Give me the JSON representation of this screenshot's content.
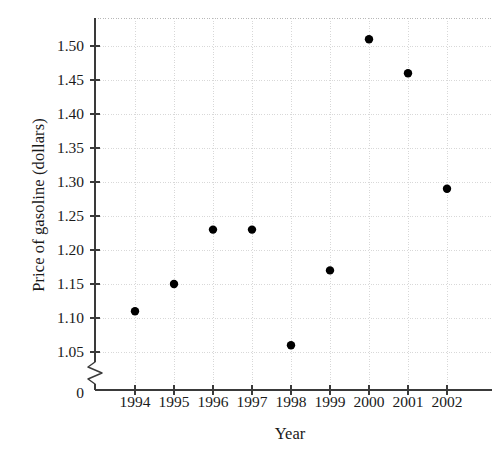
{
  "chart_data": {
    "type": "scatter",
    "title": "",
    "xlabel": "Year",
    "ylabel": "Price of gasoline (dollars)",
    "x": [
      1994,
      1995,
      1996,
      1997,
      1998,
      1999,
      2000,
      2001,
      2002
    ],
    "values": [
      1.11,
      1.15,
      1.23,
      1.23,
      1.06,
      1.17,
      1.51,
      1.46,
      1.29
    ],
    "points": [
      {
        "year": "1994",
        "price": "1.11"
      },
      {
        "year": "1995",
        "price": "1.15"
      },
      {
        "year": "1996",
        "price": "1.23"
      },
      {
        "year": "1997",
        "price": "1.23"
      },
      {
        "year": "1998",
        "price": "1.06"
      },
      {
        "year": "1999",
        "price": "1.17"
      },
      {
        "year": "2000",
        "price": "1.51"
      },
      {
        "year": "2001",
        "price": "1.46"
      },
      {
        "year": "2002",
        "price": "1.29"
      }
    ],
    "xlim": [
      1993.5,
      2002.7
    ],
    "ylim": [
      1.02,
      1.525
    ],
    "y_ticks": [
      "1.50",
      "1.45",
      "1.40",
      "1.35",
      "1.30",
      "1.25",
      "1.20",
      "1.15",
      "1.10",
      "1.05"
    ],
    "y_tick_values": [
      1.5,
      1.45,
      1.4,
      1.35,
      1.3,
      1.25,
      1.2,
      1.15,
      1.1,
      1.05
    ],
    "y_origin_label": "0",
    "x_ticks": [
      "1994",
      "1995",
      "1996",
      "1997",
      "1998",
      "1999",
      "2000",
      "2001",
      "2002"
    ],
    "grid": true,
    "axis_break": true,
    "legend": "none",
    "marker_color": "#000000",
    "grid_color": "#d8d8d8",
    "axis_color": "#3a3a3a"
  }
}
